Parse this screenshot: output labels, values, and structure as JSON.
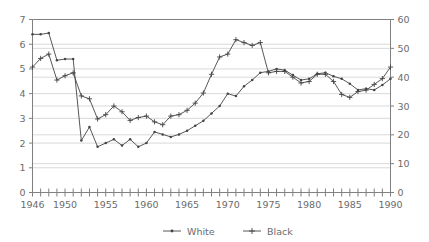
{
  "chart_data": {
    "type": "line",
    "title": "",
    "subtitle": "",
    "xlabel": "",
    "ylabel": "",
    "y2label": "",
    "xlim": [
      1946,
      1990
    ],
    "ylim": [
      0,
      7
    ],
    "y2lim": [
      0,
      60
    ],
    "grid": true,
    "legend_position": "bottom",
    "x": [
      1946,
      1947,
      1948,
      1949,
      1950,
      1951,
      1952,
      1953,
      1954,
      1955,
      1956,
      1957,
      1958,
      1959,
      1960,
      1961,
      1962,
      1963,
      1964,
      1965,
      1966,
      1967,
      1968,
      1969,
      1970,
      1971,
      1972,
      1973,
      1974,
      1975,
      1976,
      1977,
      1978,
      1979,
      1980,
      1981,
      1982,
      1983,
      1984,
      1985,
      1986,
      1987,
      1988,
      1989,
      1990
    ],
    "xticklabels": [
      "1946",
      "1950",
      "1955",
      "1960",
      "1965",
      "1970",
      "1975",
      "1980",
      "1985",
      "1990"
    ],
    "xtickvalues": [
      1946,
      1950,
      1955,
      1960,
      1965,
      1970,
      1975,
      1980,
      1985,
      1990
    ],
    "yticklabels": [
      "0",
      "1",
      "2",
      "3",
      "4",
      "5",
      "6",
      "7"
    ],
    "ytickvalues": [
      0,
      1,
      2,
      3,
      4,
      5,
      6,
      7
    ],
    "y2ticklabels": [
      "0",
      "10",
      "20",
      "30",
      "40",
      "50",
      "60"
    ],
    "y2tickvalues": [
      0,
      10,
      20,
      30,
      40,
      50,
      60
    ],
    "series": [
      {
        "name": "White",
        "axis": "left",
        "marker": "dot",
        "color": "#444444",
        "values": [
          6.4,
          6.4,
          6.45,
          5.35,
          5.4,
          5.4,
          2.1,
          2.65,
          1.85,
          2.0,
          2.15,
          1.9,
          2.15,
          1.85,
          2.0,
          2.45,
          2.35,
          2.25,
          2.35,
          2.5,
          2.7,
          2.9,
          3.2,
          3.5,
          4.0,
          3.9,
          4.3,
          4.55,
          4.85,
          4.9,
          5.0,
          4.95,
          4.75,
          4.55,
          4.6,
          4.8,
          4.85,
          4.7,
          4.6,
          4.4,
          4.15,
          4.2,
          4.15,
          4.35,
          4.6
        ]
      },
      {
        "name": "Black",
        "axis": "right",
        "marker": "plus",
        "color": "#444444",
        "values": [
          43.5,
          46.5,
          48.0,
          39.0,
          40.5,
          41.5,
          33.5,
          32.5,
          25.5,
          27.0,
          30.0,
          28.0,
          25.0,
          26.0,
          26.5,
          24.5,
          23.5,
          26.5,
          27.0,
          28.5,
          31.0,
          34.5,
          41.0,
          47.0,
          48.0,
          53.0,
          52.0,
          51.0,
          52.0,
          41.5,
          42.0,
          42.0,
          40.0,
          38.0,
          38.5,
          41.0,
          41.0,
          38.5,
          34.0,
          33.0,
          35.0,
          35.5,
          37.5,
          39.5,
          43.5
        ]
      }
    ],
    "legend": [
      {
        "label": "White",
        "marker": "dot"
      },
      {
        "label": "Black",
        "marker": "plus"
      }
    ]
  },
  "style": {
    "background": "#ffffff",
    "axis_color": "#808080",
    "grid_color": "#d9d9d9",
    "line_color": "#444444",
    "text_color": "#6b6b6b"
  }
}
